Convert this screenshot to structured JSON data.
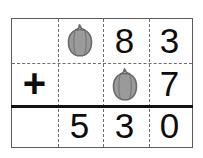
{
  "worksheet": {
    "type": "column-addition",
    "operator": "+",
    "columns": 4,
    "rows": 3,
    "icon_name": "bell-pepper-icon",
    "icon_colors": {
      "body": "#9a9a9a",
      "outline": "#6a6a6a",
      "stem": "#8f8f8f"
    },
    "grid_colors": {
      "border": "#5c5c5c",
      "dashed_divider": "#6e6e6e",
      "sum_rule": "#111111",
      "digit": "#0d0d0d",
      "background": "#ffffff"
    },
    "rows_data": [
      {
        "name": "addend-1",
        "cells": [
          {
            "kind": "empty",
            "text": ""
          },
          {
            "kind": "icon",
            "text": ""
          },
          {
            "kind": "digit",
            "text": "8"
          },
          {
            "kind": "digit",
            "text": "3"
          }
        ]
      },
      {
        "name": "addend-2",
        "cells": [
          {
            "kind": "operator",
            "text": "+"
          },
          {
            "kind": "empty",
            "text": ""
          },
          {
            "kind": "icon",
            "text": ""
          },
          {
            "kind": "digit",
            "text": "7"
          }
        ]
      },
      {
        "name": "sum",
        "cells": [
          {
            "kind": "empty",
            "text": ""
          },
          {
            "kind": "digit",
            "text": "5"
          },
          {
            "kind": "digit",
            "text": "3"
          },
          {
            "kind": "digit",
            "text": "0"
          }
        ]
      }
    ]
  }
}
